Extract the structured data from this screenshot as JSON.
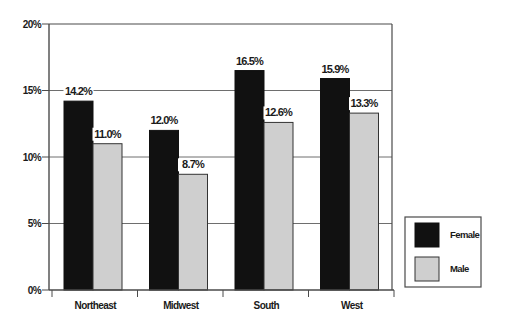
{
  "chart_data": {
    "type": "bar",
    "title": "",
    "xlabel": "",
    "ylabel": "",
    "categories": [
      "Northeast",
      "Midwest",
      "South",
      "West"
    ],
    "series": [
      {
        "name": "Female",
        "values": [
          14.2,
          12.0,
          16.5,
          15.9
        ],
        "labels": [
          "14.2%",
          "12.0%",
          "16.5%",
          "15.9%"
        ],
        "color": "#111111"
      },
      {
        "name": "Male",
        "values": [
          11.0,
          8.7,
          12.6,
          13.3
        ],
        "labels": [
          "11.0%",
          "8.7%",
          "12.6%",
          "13.3%"
        ],
        "color": "#cfcfcf"
      }
    ],
    "ylim": [
      0,
      20
    ],
    "yticks": [
      0,
      5,
      10,
      15,
      20
    ],
    "ytick_labels": [
      "0%",
      "5%",
      "10%",
      "15%",
      "20%"
    ],
    "grid": true,
    "legend_position": "right-bottom"
  },
  "legend": {
    "items": [
      {
        "label": "Female",
        "color": "#111111"
      },
      {
        "label": "Male",
        "color": "#cfcfcf"
      }
    ]
  },
  "colors": {
    "frame": "#4a4a4a",
    "grid": "#6e6e6e",
    "bar_outline": "#333333"
  }
}
